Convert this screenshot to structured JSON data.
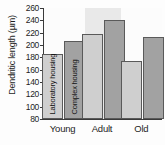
{
  "chart_data": {
    "type": "bar",
    "title": "",
    "xlabel": "",
    "ylabel": "Dendritic length (µm)",
    "categories": [
      "Young",
      "Adult",
      "Old"
    ],
    "series": [
      {
        "name": "Laboratory housing",
        "values": [
          186,
          218,
          174
        ],
        "color": "#cfcfcf"
      },
      {
        "name": "Complex housing",
        "values": [
          206,
          241,
          213
        ],
        "color": "#a2a2a2"
      }
    ],
    "ylim": [
      80,
      260
    ],
    "ytick_step": 20,
    "yticks": [
      80,
      100,
      120,
      140,
      160,
      180,
      200,
      220,
      240,
      260
    ],
    "ytick_labels": [
      "80",
      "100",
      "120",
      "140",
      "160",
      "180",
      "200",
      "220",
      "240",
      "260"
    ],
    "grid": false,
    "legend": "in-bar",
    "legend_entries": [
      "Laboratory housing",
      "Complex housing"
    ],
    "shaded_group": "Adult",
    "shaded_band_color": "#e9e9e9",
    "axis_color": "#3a3a3a",
    "bar_edge_color": "#5a5a5a",
    "background": "#fcfcfc"
  }
}
